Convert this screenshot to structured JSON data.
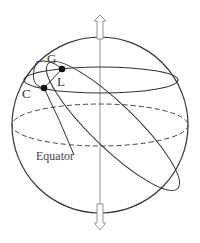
{
  "diagram": {
    "type": "celestial-sphere",
    "labels": {
      "point_g": "G",
      "point_l": "L",
      "point_c": "C",
      "equator": "Equator"
    },
    "colors": {
      "stroke": "#333333",
      "axis": "#888888",
      "background": "#ffffff"
    },
    "elements": [
      "sphere-outline",
      "polar-axis",
      "north-arrow",
      "south-arrow",
      "latitude-circle",
      "equator-dashed",
      "tilted-great-circle",
      "small-circle-gc",
      "point-l",
      "point-c"
    ]
  }
}
